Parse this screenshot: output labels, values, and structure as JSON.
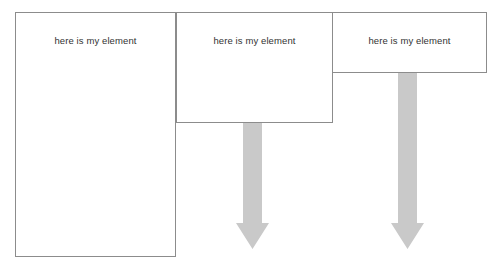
{
  "diagram": {
    "canvas": {
      "width": 504,
      "height": 270,
      "background": "#ffffff"
    },
    "style": {
      "box_border_color": "#8c8c8c",
      "box_fill": "#ffffff",
      "arrow_fill": "#c9c9c9",
      "text_color": "#333333"
    },
    "boxes": [
      {
        "id": "box-1",
        "label": "here is my element",
        "x": 15,
        "y": 12,
        "width": 161,
        "height": 245,
        "label_top": 35
      },
      {
        "id": "box-2",
        "label": "here is my element",
        "x": 176,
        "y": 12,
        "width": 157,
        "height": 111,
        "label_top": 35
      },
      {
        "id": "box-3",
        "label": "here is my element",
        "x": 332,
        "y": 12,
        "width": 155,
        "height": 61,
        "label_top": 35
      }
    ],
    "arrows": [
      {
        "id": "arrow-1",
        "direction": "down",
        "from_box": "box-2",
        "shaft_left": 243,
        "shaft_right": 262,
        "head_left": 236,
        "head_right": 269,
        "top": 123,
        "head_top": 223,
        "tip": 249
      },
      {
        "id": "arrow-2",
        "direction": "down",
        "from_box": "box-3",
        "shaft_left": 398,
        "shaft_right": 417,
        "head_left": 391,
        "head_right": 424,
        "top": 73,
        "head_top": 223,
        "tip": 249
      }
    ]
  }
}
